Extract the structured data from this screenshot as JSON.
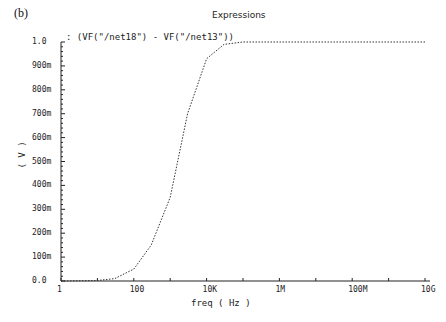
{
  "panel_label": "(b)",
  "window_title": "Expressions",
  "chart_data": {
    "type": "line",
    "title": "Expressions",
    "legend": [
      ": (VF(\"/net18\") - VF(\"/net13\"))"
    ],
    "xlabel": "freq ( Hz )",
    "ylabel": "( V )",
    "xscale": "log",
    "xlim": [
      1,
      10000000000
    ],
    "ylim": [
      0,
      1.0
    ],
    "x_ticks": [
      "1",
      "100",
      "10K",
      "1M",
      "100M",
      "10G"
    ],
    "y_ticks": [
      "0.0",
      "100m",
      "200m",
      "300m",
      "400m",
      "500m",
      "600m",
      "700m",
      "800m",
      "900m",
      "1.0"
    ],
    "series": [
      {
        "name": "VF(\"/net18\") - VF(\"/net13\")",
        "x": [
          1,
          10,
          30,
          100,
          300,
          1000,
          3000,
          10000,
          30000,
          100000,
          1000000,
          100000000,
          10000000000
        ],
        "values": [
          0.0,
          0.002,
          0.01,
          0.05,
          0.15,
          0.35,
          0.7,
          0.93,
          0.99,
          1.0,
          1.0,
          1.0,
          1.0
        ]
      }
    ],
    "grid": false
  }
}
